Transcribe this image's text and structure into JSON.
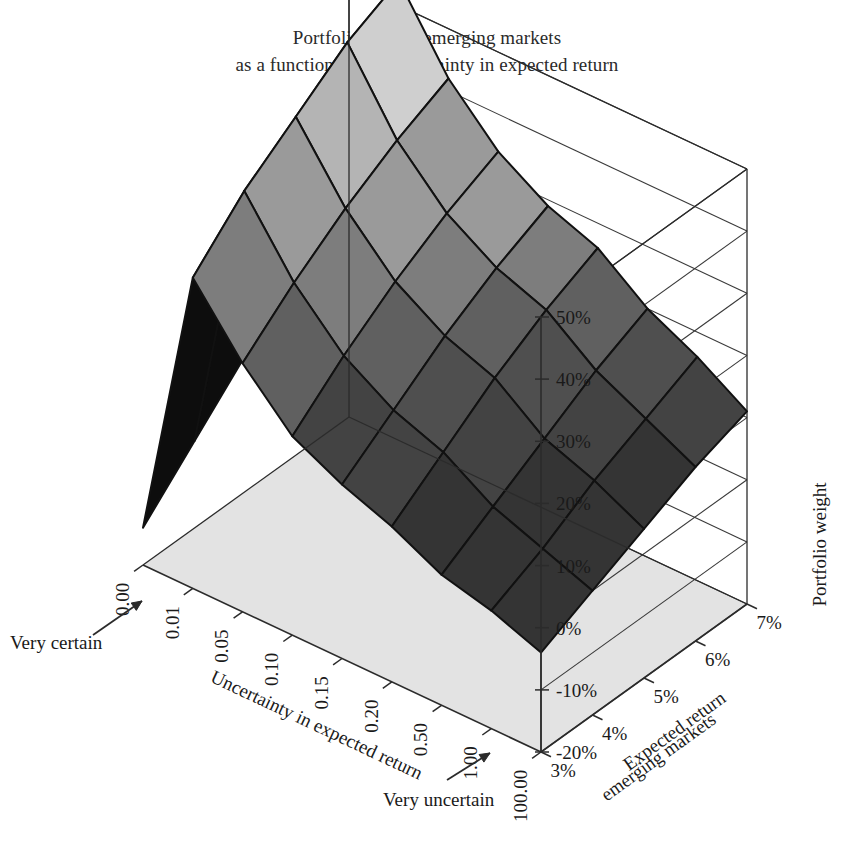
{
  "title": {
    "line1": "Portfolio weight emerging markets",
    "line2": "as a function of the uncertainty in expected return"
  },
  "annotations": {
    "very_certain": "Very certain",
    "very_uncertain": "Very uncertain"
  },
  "colors": {
    "background": "#ffffff",
    "axis_line": "#2b2b2b",
    "grid_line": "#3a3a3a",
    "floor": "#e3e3e3",
    "mesh_edge": "#111111",
    "surface_light": "#cfcfcf",
    "surface_mid": "#8f8f8f",
    "surface_dark": "#4a4a4a",
    "surface_darkest": "#0d0d0d",
    "text": "#1a1a1a"
  },
  "chart_data": {
    "type": "surface",
    "title": "Portfolio weight emerging markets as a function of the uncertainty in expected return",
    "xlabel": "Uncertainty in expected return",
    "ylabel": "Expected return emerging markets",
    "zlabel": "Portfolio weight",
    "grid": true,
    "legend": "none",
    "x_categories": [
      "0.00",
      "0.01",
      "0.05",
      "0.10",
      "0.15",
      "0.20",
      "0.50",
      "1.00",
      "100.00"
    ],
    "y_categories": [
      "3%",
      "4%",
      "5%",
      "6%",
      "7%"
    ],
    "z_ticks": [
      "50%",
      "40%",
      "30%",
      "20%",
      "10%",
      "0%",
      "-10%",
      "-20%"
    ],
    "zlim": [
      -20,
      50
    ],
    "z_values_percent": [
      [
        -14,
        -6,
        2,
        10,
        18
      ],
      [
        30,
        38,
        44,
        50,
        54
      ],
      [
        20,
        27,
        33,
        38,
        42
      ],
      [
        12,
        19,
        25,
        30,
        34
      ],
      [
        8,
        14,
        20,
        25,
        29
      ],
      [
        5,
        11,
        17,
        22,
        26
      ],
      [
        1,
        6,
        11,
        16,
        20
      ],
      [
        -1,
        3,
        8,
        12,
        16
      ],
      [
        -4,
        0,
        4,
        8,
        11
      ]
    ]
  },
  "axes": {
    "z_axis_title": "Portfolio weight",
    "x_axis_title": "Uncertainty in expected return",
    "y_axis_title_line1": "Expected return",
    "y_axis_title_line2": "emerging markets"
  }
}
